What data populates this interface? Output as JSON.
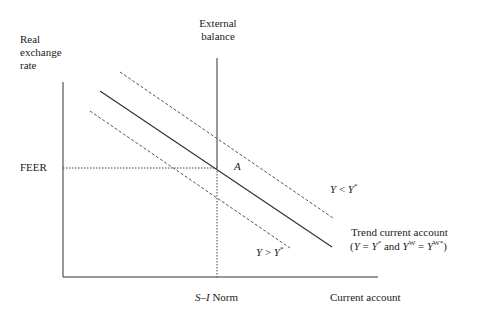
{
  "diagram": {
    "y_axis_label": [
      "Real",
      "exchange",
      "rate"
    ],
    "x_axis_label": "Current account",
    "external_balance_label": [
      "External",
      "balance"
    ],
    "feer_label": "FEER",
    "norm_label_italic": "S–I",
    "norm_label_rest": " Norm",
    "point_label": "A",
    "upper_curve_label": {
      "lhs": "Y",
      "op": " < ",
      "rhs": "Y",
      "sup": "*"
    },
    "lower_curve_label": {
      "lhs": "Y",
      "op": " > ",
      "rhs": "Y",
      "sup": "*"
    },
    "trend_label_line1": "Trend current account",
    "trend_label_line2": {
      "open": "(",
      "y1": "Y",
      "eq1": " = ",
      "y2": "Y",
      "y2_sup": "*",
      "and": " and ",
      "yw": "Y",
      "yw_sup": "W",
      "eq2": " = ",
      "yw2": "Y",
      "yw2_sup": "W*",
      "close": ")"
    }
  },
  "colors": {
    "line": "#333333",
    "dashed": "#555555",
    "background": "#ffffff"
  }
}
